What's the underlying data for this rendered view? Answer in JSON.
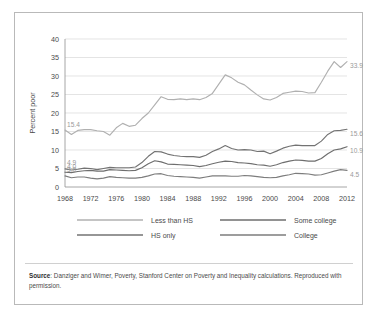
{
  "figure": {
    "border_color": "#b9b9b9",
    "background": "#ffffff"
  },
  "axis": {
    "ylabel": "Percent poor",
    "yticks": [
      "0",
      "5",
      "10",
      "15",
      "20",
      "25",
      "30",
      "35",
      "40"
    ],
    "xticks": [
      "1968",
      "1972",
      "1976",
      "1980",
      "1984",
      "1988",
      "1992",
      "1996",
      "2000",
      "2004",
      "2008",
      "2012"
    ]
  },
  "legend": {
    "items": [
      {
        "label": "Less than HS",
        "color": "#b0b0b0"
      },
      {
        "label": "Some college",
        "color": "#6e6e6e"
      },
      {
        "label": "HS only",
        "color": "#737373"
      },
      {
        "label": "College",
        "color": "#7d7d7d"
      }
    ]
  },
  "endpoint_labels": {
    "start": [
      "15.4",
      "4.9",
      "4.0",
      "3.0"
    ],
    "end": [
      "33.9",
      "15.6",
      "10.9",
      "4.5"
    ]
  },
  "source": {
    "strong": "Source",
    "text": ": Danziger and Wimer, Poverty, Stanford Center on Poverty and Inequality calculations. Reproduced with permission."
  },
  "chart_data": {
    "type": "line",
    "title": "",
    "xlabel": "",
    "ylabel": "Percent poor",
    "xlim": [
      1968,
      2012
    ],
    "ylim": [
      0,
      40
    ],
    "ytick_values": [
      0,
      5,
      10,
      15,
      20,
      25,
      30,
      35,
      40
    ],
    "xtick_values": [
      1968,
      1972,
      1976,
      1980,
      1984,
      1988,
      1992,
      1996,
      2000,
      2004,
      2008,
      2012
    ],
    "grid": "horizontal",
    "legend_position": "bottom",
    "x": [
      1968,
      1969,
      1970,
      1971,
      1972,
      1973,
      1974,
      1975,
      1976,
      1977,
      1978,
      1979,
      1980,
      1981,
      1982,
      1983,
      1984,
      1985,
      1986,
      1987,
      1988,
      1989,
      1990,
      1991,
      1992,
      1993,
      1994,
      1995,
      1996,
      1997,
      1998,
      1999,
      2000,
      2001,
      2002,
      2003,
      2004,
      2005,
      2006,
      2007,
      2008,
      2009,
      2010,
      2011,
      2012
    ],
    "series": [
      {
        "name": "Less than HS",
        "color": "#b0b0b0",
        "start_label": "15.4",
        "end_label": "33.9",
        "values": [
          15.4,
          14.2,
          15.3,
          15.5,
          15.5,
          15.2,
          15.0,
          14.0,
          16.0,
          17.2,
          16.4,
          16.7,
          18.5,
          20.0,
          22.2,
          24.4,
          23.7,
          23.6,
          23.8,
          23.6,
          23.8,
          23.6,
          24.2,
          25.3,
          27.8,
          30.3,
          29.5,
          28.3,
          27.6,
          26.2,
          24.9,
          23.8,
          23.5,
          24.2,
          25.3,
          25.6,
          25.9,
          25.8,
          25.4,
          25.5,
          28.3,
          31.3,
          33.9,
          32.3,
          33.9
        ]
      },
      {
        "name": "HS only",
        "color": "#737373",
        "start_label": "4.9",
        "end_label": "15.6",
        "values": [
          4.9,
          4.6,
          4.8,
          5.1,
          5.0,
          4.7,
          5.0,
          5.3,
          5.2,
          5.2,
          5.2,
          5.4,
          6.6,
          8.3,
          9.6,
          9.5,
          8.9,
          8.5,
          8.3,
          8.2,
          8.2,
          8.0,
          8.6,
          9.6,
          10.3,
          11.2,
          10.4,
          10.0,
          10.1,
          10.0,
          9.6,
          9.7,
          9.0,
          9.7,
          10.5,
          11.0,
          11.3,
          11.2,
          11.2,
          11.2,
          12.4,
          14.2,
          15.2,
          15.3,
          15.6
        ]
      },
      {
        "name": "Some college",
        "color": "#6e6e6e",
        "start_label": "4.0",
        "end_label": "10.9",
        "values": [
          4.0,
          3.9,
          4.2,
          4.4,
          4.5,
          4.3,
          4.3,
          4.7,
          4.6,
          4.5,
          4.4,
          4.5,
          5.2,
          6.3,
          7.1,
          6.8,
          6.2,
          6.1,
          6.0,
          5.9,
          5.8,
          5.5,
          5.8,
          6.3,
          6.7,
          7.0,
          6.9,
          6.6,
          6.5,
          6.3,
          6.0,
          5.9,
          5.6,
          6.0,
          6.6,
          7.0,
          7.3,
          7.2,
          7.0,
          7.0,
          7.7,
          9.0,
          10.0,
          10.3,
          10.9
        ]
      },
      {
        "name": "College",
        "color": "#7d7d7d",
        "start_label": "3.0",
        "end_label": "4.5",
        "values": [
          3.0,
          2.5,
          2.7,
          2.7,
          2.4,
          2.2,
          2.4,
          2.8,
          2.6,
          2.5,
          2.4,
          2.4,
          2.6,
          3.0,
          3.5,
          3.6,
          3.1,
          2.9,
          2.8,
          2.7,
          2.6,
          2.4,
          2.7,
          3.0,
          3.0,
          3.0,
          2.9,
          2.9,
          3.1,
          3.0,
          2.8,
          2.6,
          2.5,
          2.6,
          3.0,
          3.3,
          3.7,
          3.6,
          3.5,
          3.2,
          3.3,
          3.8,
          4.3,
          4.7,
          4.5
        ]
      }
    ]
  }
}
